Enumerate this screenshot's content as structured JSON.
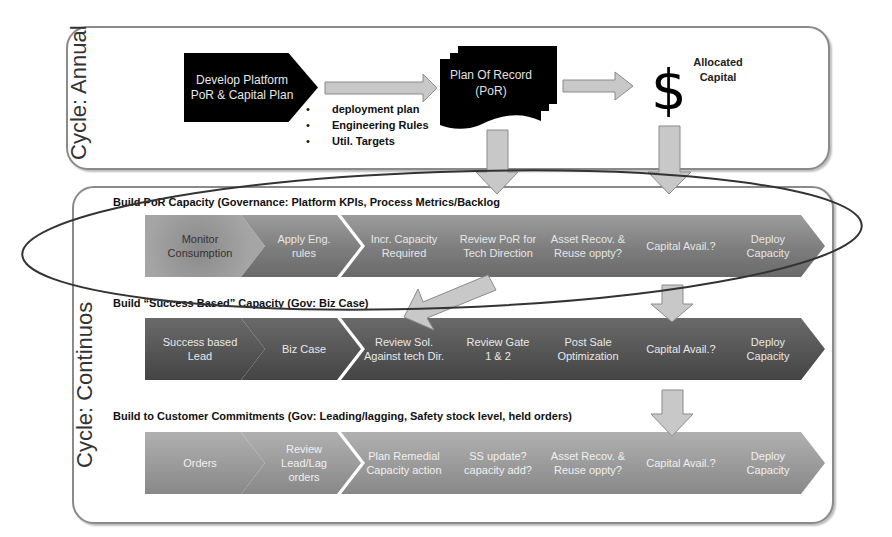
{
  "annual": {
    "cycle_label": "Cycle: Annual",
    "develop_box": {
      "line1": "Develop Platform",
      "line2": "PoR & Capital Plan"
    },
    "bullets": [
      "deployment plan",
      "Engineering Rules",
      "Util. Targets"
    ],
    "por_doc": {
      "line1": "Plan Of Record",
      "line2": "(PoR)"
    },
    "capital": {
      "symbol": "$",
      "line1": "Allocated",
      "line2": "Capital"
    }
  },
  "continuous": {
    "cycle_label": "Cycle: Continuos",
    "rows": [
      {
        "title": "Build PoR  Capacity  (Governance: Platform KPIs, Process Metrics/Backlog",
        "steps": [
          [
            "Monitor",
            "Consumption"
          ],
          [
            "Apply Eng.",
            "rules"
          ],
          [
            "Incr. Capacity",
            "Required"
          ],
          [
            "Review PoR for",
            "Tech Direction"
          ],
          [
            "Asset Recov. &",
            "Reuse oppty?"
          ],
          [
            "Capital Avail.?",
            ""
          ],
          [
            "Deploy",
            "Capacity"
          ]
        ]
      },
      {
        "title": "Build “Success Based” Capacity  (Gov:   Biz Case)",
        "steps": [
          [
            "Success based",
            "Lead"
          ],
          [
            "Biz Case",
            ""
          ],
          [
            "Review Sol.",
            "Against tech Dir."
          ],
          [
            "Review Gate",
            "1 & 2"
          ],
          [
            "Post Sale",
            "Optimization"
          ],
          [
            "Capital Avail.?",
            ""
          ],
          [
            "Deploy",
            "Capacity"
          ]
        ]
      },
      {
        "title": "Build to Customer Commitments (Gov: Leading/lagging, Safety stock level, held orders)",
        "steps": [
          [
            "Orders",
            ""
          ],
          [
            "Review Lead/Lag",
            "orders"
          ],
          [
            "Plan Remedial",
            "Capacity action"
          ],
          [
            "SS update?",
            "capacity add?"
          ],
          [
            "Asset Recov. &",
            "Reuse oppty?"
          ],
          [
            "Capital Avail.?",
            ""
          ],
          [
            "Deploy",
            "Capacity"
          ]
        ]
      }
    ]
  },
  "colors": {
    "arrow_fill": "#c8c8c8",
    "arrow_stroke": "#8a8a8a",
    "row1": "#8a8a8a",
    "row2": "#555555",
    "row3": "#a0a0a0"
  }
}
